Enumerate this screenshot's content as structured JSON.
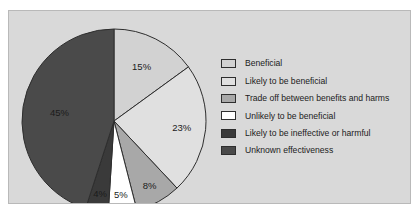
{
  "figure": {
    "panel_background": "#d9d9d9",
    "panel_border": "#b9b9b9",
    "page_background": "#ffffff"
  },
  "chart_data": {
    "type": "pie",
    "title": "",
    "xlabel": "",
    "ylabel": "",
    "grid": false,
    "legend_position": "right",
    "start_angle_deg": 0,
    "direction": "clockwise",
    "categories": [
      "Beneficial",
      "Likely to be beneficial",
      "Trade off between benefits and harms",
      "Unlikely to be beneficial",
      "Likely to be ineffective or harmful",
      "Unknown effectiveness"
    ],
    "values": [
      15,
      23,
      8,
      5,
      4,
      45
    ],
    "value_labels": [
      "15%",
      "23%",
      "8%",
      "5%",
      "4%",
      "45%"
    ],
    "colors": [
      "#d2d2d2",
      "#e0e0e0",
      "#a8a8a8",
      "#ffffff",
      "#3a3a3a",
      "#4a4a4a"
    ],
    "slice_edge_color": "#2e2e2e",
    "label_colors": [
      "#1b1b1b",
      "#1b1b1b",
      "#1b1b1b",
      "#1b1b1b",
      "#cfcfcf",
      "#cfcfcf"
    ]
  },
  "legend": {
    "items": [
      {
        "label": "Beneficial",
        "color": "#d2d2d2"
      },
      {
        "label": "Likely to be beneficial",
        "color": "#e0e0e0"
      },
      {
        "label": "Trade off between benefits and harms",
        "color": "#a8a8a8"
      },
      {
        "label": "Unlikely to be beneficial",
        "color": "#ffffff"
      },
      {
        "label": "Likely to be ineffective or harmful",
        "color": "#3a3a3a"
      },
      {
        "label": "Unknown effectiveness",
        "color": "#4a4a4a"
      }
    ]
  }
}
